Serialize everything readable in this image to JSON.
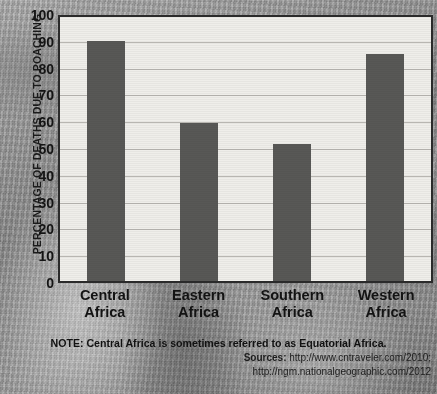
{
  "chart_data": {
    "type": "bar",
    "title": "",
    "xlabel": "",
    "ylabel": "PERCENTAGE OF DEATHS DUE TO POACHING",
    "categories": [
      "Central Africa",
      "Eastern Africa",
      "Southern Africa",
      "Western Africa"
    ],
    "values": [
      91,
      60,
      52,
      86
    ],
    "ylim": [
      0,
      100
    ],
    "ytick_labels": [
      "100",
      "90",
      "80",
      "70",
      "60",
      "50",
      "40",
      "30",
      "20",
      "10",
      "0"
    ],
    "ytick_values": [
      100,
      90,
      80,
      70,
      60,
      50,
      40,
      30,
      20,
      10,
      0
    ],
    "grid": true,
    "legend": "none",
    "bar_color": "#585856",
    "plot_background_color": "#efeeea",
    "axis_color": "#2b2b2b",
    "gridline_color": "#b8b6b1",
    "text_color": "#131313"
  },
  "category_label_lines": [
    [
      "Central",
      "Africa"
    ],
    [
      "Eastern",
      "Africa"
    ],
    [
      "Southern",
      "Africa"
    ],
    [
      "Western",
      "Africa"
    ]
  ],
  "footnotes": {
    "note": "NOTE: Central Africa is sometimes referred to as Equatorial Africa.",
    "sources_label": "Sources:",
    "source_1": "http://www.cntraveler.com/2010;",
    "source_2": "http://ngm.nationalgeographic.com/2012"
  }
}
